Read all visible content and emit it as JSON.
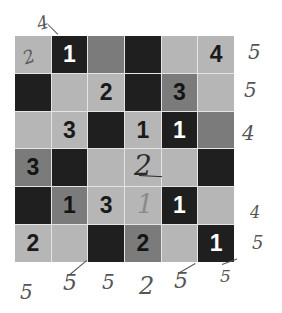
{
  "puzzle": {
    "rows": 6,
    "cols": 6,
    "colors": {
      "light": "#b6b6b6",
      "medium": "#7b7b7b",
      "dark": "#1f1f1f",
      "gridline": "#e4e4e4"
    },
    "cells": [
      [
        {
          "shade": "light",
          "value": "",
          "handwritten": "2"
        },
        {
          "shade": "dark",
          "value": "1"
        },
        {
          "shade": "medium",
          "value": ""
        },
        {
          "shade": "dark",
          "value": ""
        },
        {
          "shade": "light",
          "value": ""
        },
        {
          "shade": "light",
          "value": "4"
        }
      ],
      [
        {
          "shade": "dark",
          "value": ""
        },
        {
          "shade": "light",
          "value": ""
        },
        {
          "shade": "light",
          "value": "2"
        },
        {
          "shade": "dark",
          "value": ""
        },
        {
          "shade": "medium",
          "value": "3"
        },
        {
          "shade": "light",
          "value": ""
        }
      ],
      [
        {
          "shade": "light",
          "value": ""
        },
        {
          "shade": "light",
          "value": "3"
        },
        {
          "shade": "dark",
          "value": ""
        },
        {
          "shade": "light",
          "value": "1"
        },
        {
          "shade": "dark",
          "value": "1"
        },
        {
          "shade": "medium",
          "value": ""
        }
      ],
      [
        {
          "shade": "medium",
          "value": "3"
        },
        {
          "shade": "dark",
          "value": ""
        },
        {
          "shade": "light",
          "value": ""
        },
        {
          "shade": "light",
          "value": "",
          "handwritten": "2"
        },
        {
          "shade": "light",
          "value": ""
        },
        {
          "shade": "dark",
          "value": ""
        }
      ],
      [
        {
          "shade": "dark",
          "value": ""
        },
        {
          "shade": "medium",
          "value": "1"
        },
        {
          "shade": "light",
          "value": "3"
        },
        {
          "shade": "light",
          "value": "",
          "handwritten": "1"
        },
        {
          "shade": "dark",
          "value": "1"
        },
        {
          "shade": "light",
          "value": ""
        }
      ],
      [
        {
          "shade": "light",
          "value": "2"
        },
        {
          "shade": "light",
          "value": ""
        },
        {
          "shade": "dark",
          "value": ""
        },
        {
          "shade": "medium",
          "value": "2"
        },
        {
          "shade": "light",
          "value": ""
        },
        {
          "shade": "dark",
          "value": "1"
        }
      ]
    ]
  },
  "annotations": {
    "top": [
      {
        "col": 1,
        "text": "4"
      }
    ],
    "right": [
      "5",
      "5",
      "4",
      "",
      "4",
      "5"
    ],
    "bottom": [
      "5",
      "5",
      "5",
      "2",
      "5",
      "5"
    ]
  }
}
